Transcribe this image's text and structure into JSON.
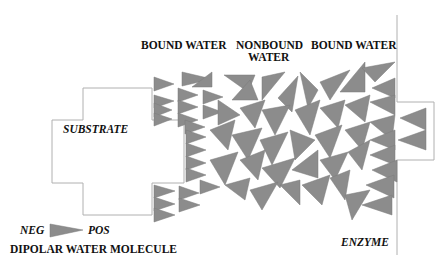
{
  "diagram": {
    "labels": {
      "bound_water_left": "BOUND WATER",
      "nonbound_water_line1": "NONBOUND",
      "nonbound_water_line2": "WATER",
      "bound_water_right": "BOUND WATER",
      "substrate": "SUBSTRATE",
      "enzyme": "ENZYME",
      "legend_neg": "NEG",
      "legend_pos": "POS",
      "legend_caption": "DIPOLAR WATER MOLECULE"
    },
    "colors": {
      "molecule_fill": "#8c8c8c",
      "molecule_stroke": "#7a7a7a",
      "outline": "#b0b0b0",
      "text": "#111111"
    },
    "elements": [
      {
        "id": "substrate",
        "shape": "stepped-block",
        "label": "SUBSTRATE"
      },
      {
        "id": "enzyme",
        "shape": "wall-with-protrusion",
        "label": "ENZYME"
      },
      {
        "id": "water",
        "shape": "triangles",
        "legend": "DIPOLAR WATER MOLECULE",
        "poles": [
          "NEG",
          "POS"
        ]
      }
    ]
  }
}
